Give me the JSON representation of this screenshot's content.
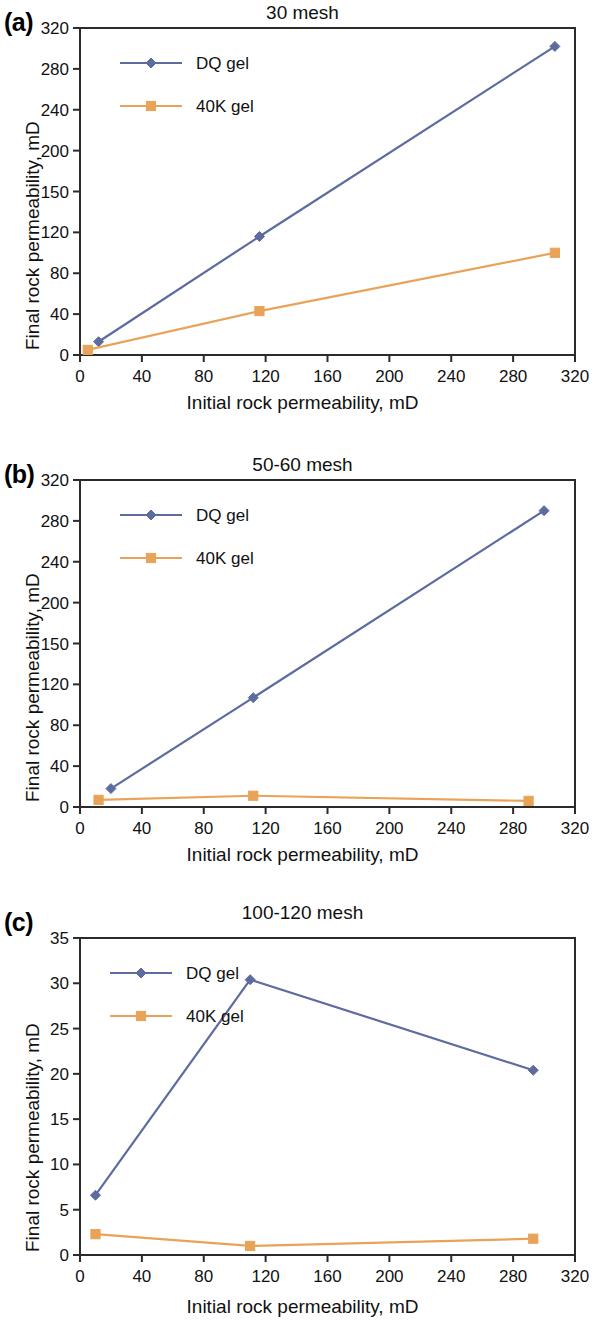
{
  "figure": {
    "axis_x_title": "Initial rock permeability, mD",
    "axis_y_title": "Final rock permeability, mD",
    "series_colors": {
      "dq_gel": "#5d6b9e",
      "40k_gel": "#e9a358"
    },
    "legend": {
      "dq_gel": "DQ gel",
      "40k_gel": "40K gel"
    }
  },
  "panels": [
    {
      "key": "a",
      "label": "(a)",
      "title": "30 mesh"
    },
    {
      "key": "b",
      "label": "(b)",
      "title": "50-60 mesh"
    },
    {
      "key": "c",
      "label": "(c)",
      "title": "100-120 mesh"
    }
  ],
  "chart_data": [
    {
      "type": "line",
      "panel": "(a)",
      "title": "30 mesh",
      "xlabel": "Initial rock permeability, mD",
      "ylabel": "Final rock permeability, mD",
      "xlim": [
        0,
        320
      ],
      "ylim": [
        0,
        320
      ],
      "xticks": [
        0,
        40,
        80,
        120,
        160,
        200,
        240,
        280,
        320
      ],
      "xticklabels": [
        "0",
        "40",
        "80",
        "120",
        "160",
        "200",
        "240",
        "280",
        "320"
      ],
      "yticks": [
        0,
        40,
        80,
        120,
        160,
        200,
        240,
        280,
        320
      ],
      "yticklabels": [
        "0",
        "40",
        "80",
        "120",
        "150",
        "200",
        "240",
        "280",
        "320"
      ],
      "grid": false,
      "legend_position": "upper left",
      "series": [
        {
          "name": "DQ gel",
          "color": "#5d6b9e",
          "marker": "diamond",
          "x": [
            12,
            116,
            307
          ],
          "y": [
            13,
            116,
            302
          ]
        },
        {
          "name": "40K gel",
          "color": "#e9a358",
          "marker": "square",
          "x": [
            5,
            116,
            307
          ],
          "y": [
            5,
            43,
            100
          ]
        }
      ]
    },
    {
      "type": "line",
      "panel": "(b)",
      "title": "50-60 mesh",
      "xlabel": "Initial rock permeability, mD",
      "ylabel": "Final rock permeability, mD",
      "xlim": [
        0,
        320
      ],
      "ylim": [
        0,
        320
      ],
      "xticks": [
        0,
        40,
        80,
        120,
        160,
        200,
        240,
        280,
        320
      ],
      "xticklabels": [
        "0",
        "40",
        "80",
        "120",
        "160",
        "200",
        "240",
        "280",
        "320"
      ],
      "yticks": [
        0,
        40,
        80,
        120,
        160,
        200,
        240,
        280,
        320
      ],
      "yticklabels": [
        "0",
        "40",
        "80",
        "120",
        "150",
        "200",
        "240",
        "280",
        "320"
      ],
      "grid": false,
      "legend_position": "upper left",
      "series": [
        {
          "name": "DQ gel",
          "color": "#5d6b9e",
          "marker": "diamond",
          "x": [
            20,
            112,
            300
          ],
          "y": [
            18,
            107,
            290
          ]
        },
        {
          "name": "40K gel",
          "color": "#e9a358",
          "marker": "square",
          "x": [
            12,
            112,
            290
          ],
          "y": [
            7,
            11,
            6
          ]
        }
      ]
    },
    {
      "type": "line",
      "panel": "(c)",
      "title": "100-120 mesh",
      "xlabel": "Initial rock permeability, mD",
      "ylabel": "Final rock permeability, mD",
      "xlim": [
        0,
        320
      ],
      "ylim": [
        0,
        35
      ],
      "xticks": [
        0,
        40,
        80,
        120,
        160,
        200,
        240,
        280,
        320
      ],
      "xticklabels": [
        "0",
        "40",
        "80",
        "120",
        "160",
        "200",
        "240",
        "280",
        "320"
      ],
      "yticks": [
        0,
        5,
        10,
        15,
        20,
        25,
        30,
        35
      ],
      "yticklabels": [
        "0",
        "5",
        "10",
        "15",
        "20",
        "25",
        "30",
        "35"
      ],
      "grid": false,
      "legend_position": "upper left",
      "series": [
        {
          "name": "DQ gel",
          "color": "#5d6b9e",
          "marker": "diamond",
          "x": [
            10,
            110,
            293
          ],
          "y": [
            6.6,
            30.4,
            20.4
          ]
        },
        {
          "name": "40K gel",
          "color": "#e9a358",
          "marker": "square",
          "x": [
            10,
            110,
            293
          ],
          "y": [
            2.3,
            1.0,
            1.8
          ]
        }
      ]
    }
  ]
}
